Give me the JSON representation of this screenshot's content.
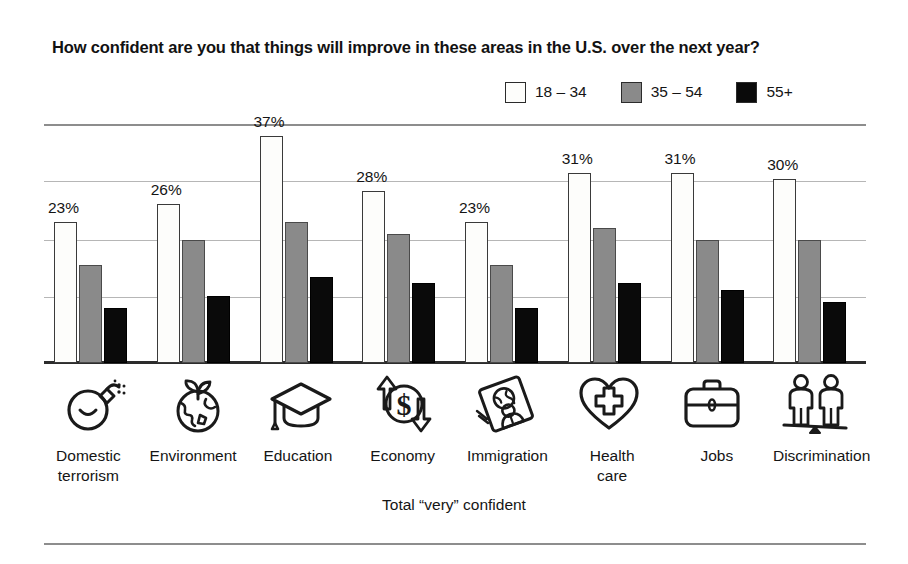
{
  "title": "How confident are you that things will improve in these areas in the U.S. over the next year?",
  "footnote": "Total “very” confident",
  "legend": {
    "items": [
      {
        "label": "18 – 34",
        "color": "#fdfdfb"
      },
      {
        "label": "35 – 54",
        "color": "#8a8a8a"
      },
      {
        "label": "55+",
        "color": "#0a0a0a"
      }
    ]
  },
  "icons": [
    {
      "name": "bomb-icon",
      "category": "Domestic terrorism"
    },
    {
      "name": "globe-plant-icon",
      "category": "Environment"
    },
    {
      "name": "graduation-cap-icon",
      "category": "Education"
    },
    {
      "name": "dollar-cycle-icon",
      "category": "Economy"
    },
    {
      "name": "passport-person-globe-icon",
      "category": "Immigration"
    },
    {
      "name": "heart-cross-icon",
      "category": "Health care"
    },
    {
      "name": "briefcase-icon",
      "category": "Jobs"
    },
    {
      "name": "two-people-seesaw-icon",
      "category": "Discrimination"
    }
  ],
  "categories_display": [
    "Domestic\nterrorism",
    "Environment",
    "Education",
    "Economy",
    "Immigration",
    "Health\ncare",
    "Jobs",
    "Discrimination"
  ],
  "chart_data": {
    "type": "bar",
    "title": "How confident are you that things will improve in these areas in the U.S. over the next year?",
    "subtitle": "Total “very” confident",
    "xlabel": "",
    "ylabel": "",
    "ylim": [
      0,
      39
    ],
    "grid": true,
    "gridlines": [
      11,
      20,
      30,
      37
    ],
    "legend_position": "top-right",
    "categories": [
      "Domestic terrorism",
      "Environment",
      "Education",
      "Economy",
      "Immigration",
      "Health care",
      "Jobs",
      "Discrimination"
    ],
    "series": [
      {
        "name": "18 – 34",
        "color": "#fdfdfb",
        "values": [
          23,
          26,
          37,
          28,
          23,
          31,
          31,
          30
        ],
        "labels": [
          "23%",
          "26%",
          "37%",
          "28%",
          "23%",
          "31%",
          "31%",
          "30%"
        ]
      },
      {
        "name": "35 – 54",
        "color": "#8a8a8a",
        "values": [
          16,
          20,
          23,
          21,
          16,
          22,
          20,
          20
        ],
        "labels": [
          "",
          "",
          "",
          "",
          "",
          "",
          "",
          ""
        ]
      },
      {
        "name": "55+",
        "color": "#0a0a0a",
        "values": [
          9,
          11,
          14,
          13,
          9,
          13,
          12,
          10
        ],
        "labels": [
          "",
          "",
          "",
          "",
          "",
          "",
          "",
          ""
        ]
      }
    ]
  }
}
